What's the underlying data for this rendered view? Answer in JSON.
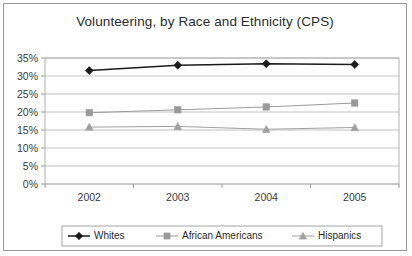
{
  "chart_data": {
    "type": "line",
    "title": "Volunteering, by Race and Ethnicity (CPS)",
    "xlabel": "",
    "ylabel": "",
    "categories": [
      "2002",
      "2003",
      "2004",
      "2005"
    ],
    "x": [
      2002,
      2003,
      2004,
      2005
    ],
    "ylim": [
      0,
      35
    ],
    "ytick_values": [
      0,
      5,
      10,
      15,
      20,
      25,
      30,
      35
    ],
    "ytick_labels": [
      "0%",
      "5%",
      "10%",
      "15%",
      "20%",
      "25%",
      "30%",
      "35%"
    ],
    "grid": true,
    "legend_position": "bottom",
    "series": [
      {
        "name": "Whites",
        "marker": "diamond",
        "color": "#1a1a1a",
        "values": [
          31.5,
          33.0,
          33.4,
          33.2
        ]
      },
      {
        "name": "African Americans",
        "marker": "square",
        "color": "#9a9a9a",
        "values": [
          19.8,
          20.6,
          21.4,
          22.5
        ]
      },
      {
        "name": "Hispanics",
        "marker": "triangle",
        "color": "#a0a0a0",
        "values": [
          15.8,
          16.0,
          15.2,
          15.7
        ]
      }
    ]
  },
  "frame": {
    "border_color": "#9a9a9a",
    "background": "#ffffff"
  }
}
